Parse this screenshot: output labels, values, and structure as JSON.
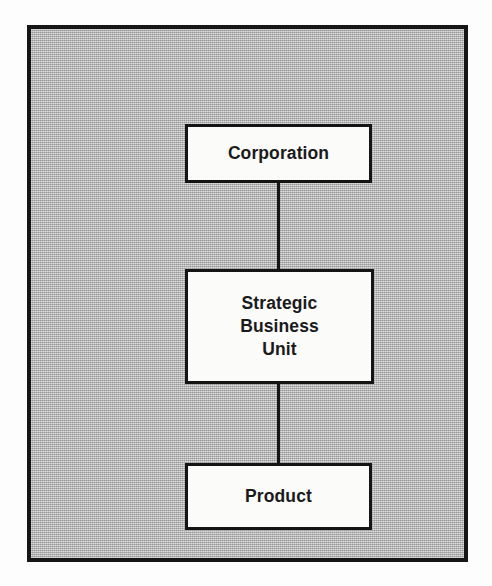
{
  "figure": {
    "type": "hierarchy-diagram",
    "orientation": "vertical-top-down",
    "frame": {
      "border_color": "#161616",
      "fill_color": "#b9b9b9",
      "fill_style": "halftone-screen"
    },
    "node_style": {
      "fill_color": "#fbfbfa",
      "border_color": "#141414",
      "text_color": "#1a1a1a"
    },
    "connector_color": "#161616"
  },
  "nodes": [
    {
      "id": "corporation",
      "label": "Corporation",
      "level": 1
    },
    {
      "id": "strategic-business-unit",
      "label": "Strategic\nBusiness\nUnit",
      "level": 2
    },
    {
      "id": "product",
      "label": "Product",
      "level": 3
    }
  ],
  "connectors": [
    {
      "id": "corp-to-sbu",
      "from": "corporation",
      "to": "strategic-business-unit"
    },
    {
      "id": "sbu-to-product",
      "from": "strategic-business-unit",
      "to": "product"
    }
  ]
}
